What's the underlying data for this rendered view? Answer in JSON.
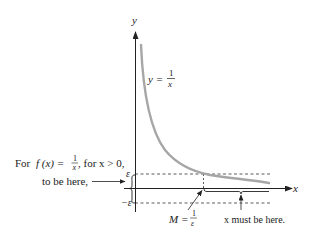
{
  "diagram": {
    "axes": {
      "x_label": "x",
      "y_label": "y"
    },
    "curve": {
      "label_lhs": "y =",
      "label_num": "1",
      "label_den": "x",
      "color": "#a6a6a6"
    },
    "bands": {
      "epsilon_label": "ε",
      "neg_epsilon_label": "−ε"
    },
    "annotations": {
      "left_line1_prefix": "For",
      "left_line1_fx": "f (x) =",
      "left_line1_num": "1",
      "left_line1_den": "x",
      "left_line1_suffix": ", for x > 0,",
      "left_line2": "to be here,",
      "m_lhs": "M =",
      "m_num": "1",
      "m_den": "ε",
      "x_region": "x must be here."
    }
  }
}
